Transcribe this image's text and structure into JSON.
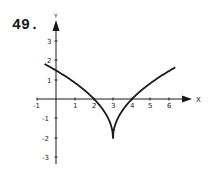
{
  "problem_number": "49.",
  "chart_data": {
    "type": "line",
    "title": "",
    "xlabel": "X",
    "ylabel": "Y",
    "xlim": [
      -1,
      6.5
    ],
    "ylim": [
      -3.5,
      4
    ],
    "x_ticks": [
      "-1",
      "1",
      "2",
      "3",
      "4",
      "5",
      "6"
    ],
    "y_ticks": [
      "3",
      "2",
      "1",
      "-1",
      "-2",
      "-3"
    ],
    "grid": false,
    "legend": null,
    "series": [
      {
        "name": "curve",
        "description": "cusp at (3,-2), x-intercepts at 2 and 4",
        "x": [
          -0.6,
          0,
          1,
          2,
          2.5,
          2.9,
          3,
          3.1,
          3.5,
          4,
          5,
          6.3
        ],
        "y": [
          1.79,
          1.46,
          0.83,
          0,
          -0.59,
          -1.37,
          -2,
          -1.37,
          -0.59,
          0,
          0.83,
          1.63
        ]
      }
    ],
    "annotations": {
      "cusp": [
        3,
        -2
      ],
      "x_intercepts": [
        2,
        4
      ],
      "y_intercept": 1.46
    }
  }
}
